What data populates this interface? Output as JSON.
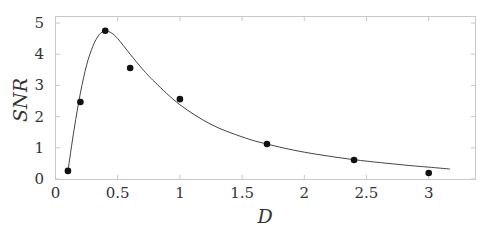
{
  "chart_data": {
    "type": "scatter",
    "title": "",
    "xlabel": "D",
    "ylabel": "SNR",
    "xlim": [
      0,
      3.3
    ],
    "ylim": [
      0,
      5.2
    ],
    "xticks": [
      0,
      0.5,
      1,
      1.5,
      2,
      2.5,
      3
    ],
    "xtick_labels": [
      "0",
      "0.5",
      "1",
      "1.5",
      "2",
      "2.5",
      "3"
    ],
    "yticks": [
      0,
      1,
      2,
      3,
      4,
      5
    ],
    "ytick_labels": [
      "0",
      "1",
      "2",
      "3",
      "4",
      "5"
    ],
    "grid": false,
    "legend": null,
    "series": [
      {
        "name": "measured",
        "kind": "scatter",
        "x": [
          0.1,
          0.2,
          0.4,
          0.6,
          1.0,
          1.7,
          2.4,
          3.0
        ],
        "y": [
          0.26,
          2.47,
          4.75,
          3.56,
          2.56,
          1.12,
          0.61,
          0.19
        ]
      },
      {
        "name": "fit",
        "kind": "line",
        "x": [
          0.1,
          0.15,
          0.2,
          0.25,
          0.3,
          0.35,
          0.4,
          0.45,
          0.5,
          0.6,
          0.7,
          0.8,
          1.0,
          1.25,
          1.5,
          1.7,
          2.0,
          2.4,
          2.8,
          3.0,
          3.17
        ],
        "y": [
          0.26,
          1.6,
          2.75,
          3.65,
          4.25,
          4.62,
          4.75,
          4.68,
          4.5,
          4.0,
          3.52,
          3.1,
          2.38,
          1.75,
          1.35,
          1.12,
          0.86,
          0.62,
          0.45,
          0.38,
          0.32
        ]
      }
    ]
  }
}
